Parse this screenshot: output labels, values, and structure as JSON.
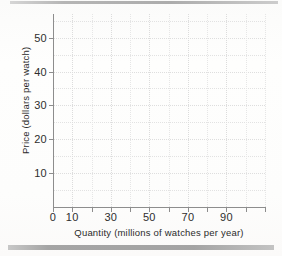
{
  "chart_data": {
    "type": "line",
    "title": "",
    "subtitle": "",
    "xlabel": "Quantity (millions of watches per year)",
    "ylabel": "Price (dollars per watch)",
    "xlim": [
      0,
      110
    ],
    "ylim": [
      0,
      57
    ],
    "grid": true,
    "legend": null,
    "series": [],
    "annotations": [],
    "note": "Empty plotting grid: axes and gridlines drawn, no data plotted.",
    "x_ticks": [
      {
        "value": 0,
        "label": "0",
        "major": true
      },
      {
        "value": 10,
        "label": "10",
        "major": true
      },
      {
        "value": 20,
        "label": "",
        "major": false
      },
      {
        "value": 30,
        "label": "30",
        "major": true
      },
      {
        "value": 40,
        "label": "",
        "major": false
      },
      {
        "value": 50,
        "label": "50",
        "major": true
      },
      {
        "value": 60,
        "label": "",
        "major": false
      },
      {
        "value": 70,
        "label": "70",
        "major": true
      },
      {
        "value": 80,
        "label": "",
        "major": false
      },
      {
        "value": 90,
        "label": "90",
        "major": true
      },
      {
        "value": 100,
        "label": "",
        "major": false
      },
      {
        "value": 110,
        "label": "",
        "major": false
      }
    ],
    "y_ticks": [
      {
        "value": 10,
        "label": "10",
        "major": true
      },
      {
        "value": 20,
        "label": "20",
        "major": true
      },
      {
        "value": 30,
        "label": "30",
        "major": true
      },
      {
        "value": 40,
        "label": "40",
        "major": true
      },
      {
        "value": 50,
        "label": "50",
        "major": true
      }
    ],
    "y_minor_gridlines": [
      5,
      15,
      25,
      35,
      45,
      55
    ],
    "colors": {
      "axis": "#8d8d8d",
      "grid_major": "#dcdcdc",
      "grid_minor": "#e6e6e6",
      "text": "#2e2e2e",
      "paper": "#fdfdfc",
      "rule": "#9b9b9b"
    }
  },
  "decorations": {
    "top_rule": "",
    "bottom_rule": ""
  }
}
